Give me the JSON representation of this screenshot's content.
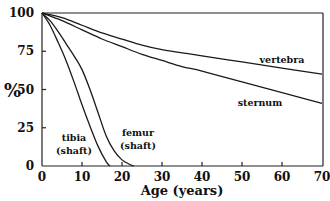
{
  "chart_data": {
    "type": "line",
    "title": "",
    "xlabel": "Age (years)",
    "ylabel": "%",
    "xlim": [
      0,
      70
    ],
    "ylim": [
      0,
      100
    ],
    "xticks": [
      0,
      10,
      20,
      30,
      40,
      50,
      60,
      70
    ],
    "yticks": [
      0,
      25,
      50,
      75,
      100
    ],
    "grid": false,
    "series": [
      {
        "name": "vertebra",
        "label_lines": [
          "vertebra"
        ],
        "x": [
          0,
          5,
          10,
          15,
          20,
          25,
          30,
          35,
          40,
          50,
          60,
          70
        ],
        "y": [
          100,
          97,
          92,
          87,
          83,
          79,
          76,
          74,
          72,
          68,
          64,
          60
        ]
      },
      {
        "name": "sternum",
        "label_lines": [
          "sternum"
        ],
        "x": [
          0,
          5,
          10,
          15,
          20,
          25,
          30,
          35,
          40,
          50,
          60,
          70
        ],
        "y": [
          100,
          95,
          89,
          83,
          78,
          73,
          69,
          65,
          62,
          55,
          48,
          41
        ]
      },
      {
        "name": "tibia (shaft)",
        "label_lines": [
          "tibia",
          "(shaft)"
        ],
        "x": [
          0,
          2,
          4,
          6,
          8,
          10,
          12,
          14,
          16,
          17
        ],
        "y": [
          100,
          92,
          81,
          69,
          55,
          40,
          26,
          13,
          3,
          0
        ]
      },
      {
        "name": "femur (shaft)",
        "label_lines": [
          "femur",
          "(shaft)"
        ],
        "x": [
          0,
          2,
          4,
          6,
          8,
          10,
          12,
          14,
          16,
          18,
          20,
          22,
          23
        ],
        "y": [
          100,
          95,
          88,
          80,
          72,
          63,
          50,
          35,
          20,
          10,
          4,
          1,
          0
        ]
      }
    ]
  }
}
